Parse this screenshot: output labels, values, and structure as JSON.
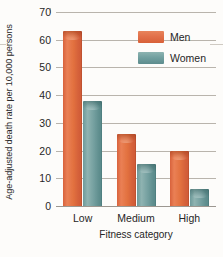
{
  "chart_data": {
    "type": "bar",
    "title": "",
    "xlabel": "Fitness category",
    "ylabel": "Age-adjusted death rate per 10,000 persons",
    "categories": [
      "Low",
      "Medium",
      "High"
    ],
    "series": [
      {
        "name": "Men",
        "color": "#e2714a",
        "values": [
          63,
          26,
          20
        ]
      },
      {
        "name": "Women",
        "color": "#6e9c9c",
        "values": [
          38,
          15,
          6
        ]
      }
    ],
    "ylim": [
      0,
      70
    ],
    "yticks": [
      0,
      10,
      20,
      30,
      40,
      50,
      60,
      70
    ],
    "ytick_labels": [
      "0",
      "10",
      "20",
      "30",
      "40",
      "50",
      "60",
      "70"
    ],
    "grid": true,
    "legend_position": "top-right"
  },
  "legend": {
    "entries": [
      {
        "label": "Men"
      },
      {
        "label": "Women"
      }
    ]
  }
}
